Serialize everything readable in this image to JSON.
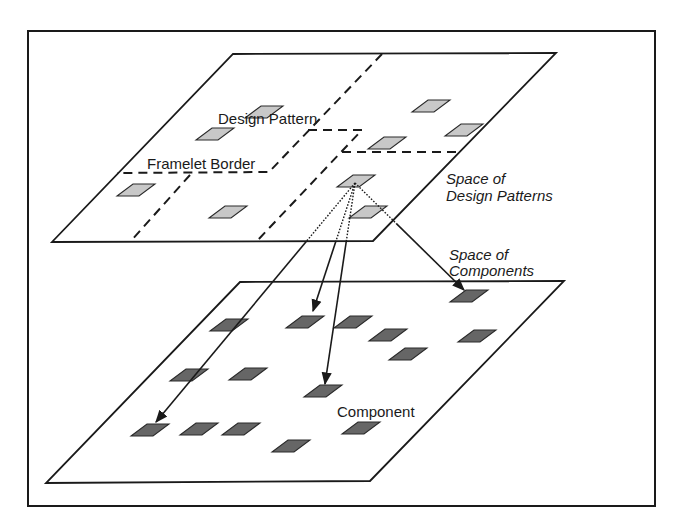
{
  "labels": {
    "design_pattern": "Design Pattern",
    "framelet_border": "Framelet Border",
    "space_design_patterns_line1": "Space of",
    "space_design_patterns_line2": "Design Patterns",
    "space_components_line1": "Space of",
    "space_components_line2": "Components",
    "component": "Component"
  },
  "colors": {
    "line": "#1a1a1a",
    "design_pattern_fill": "#c8c8c8",
    "component_fill": "#666666",
    "background": "#ffffff"
  },
  "planes": {
    "design_pattern_space": {
      "corners": [
        [
          233,
          54
        ],
        [
          556,
          53
        ],
        [
          373,
          241
        ],
        [
          52,
          242
        ]
      ]
    },
    "component_space": {
      "corners": [
        [
          240,
          282
        ],
        [
          564,
          281
        ],
        [
          370,
          481
        ],
        [
          46,
          483
        ]
      ]
    }
  },
  "framelet_borders": [
    [
      [
        382,
        54
      ],
      [
        269,
        172
      ],
      [
        117,
        173
      ]
    ],
    [
      [
        190,
        175
      ],
      [
        130,
        242
      ]
    ],
    [
      [
        308,
        130
      ],
      [
        362,
        130
      ],
      [
        256,
        242
      ]
    ],
    [
      [
        342,
        152
      ],
      [
        462,
        152
      ]
    ]
  ],
  "design_patterns": [
    [
      431,
      106
    ],
    [
      464,
      130
    ],
    [
      264,
      112
    ],
    [
      387,
      143
    ],
    [
      215,
      134
    ],
    [
      136,
      190
    ],
    [
      228,
      212
    ],
    [
      356,
      181
    ],
    [
      368,
      212
    ]
  ],
  "components": [
    [
      469,
      296
    ],
    [
      229,
      325
    ],
    [
      305,
      322
    ],
    [
      353,
      322
    ],
    [
      388,
      335
    ],
    [
      477,
      336
    ],
    [
      408,
      354
    ],
    [
      189,
      375
    ],
    [
      248,
      374
    ],
    [
      323,
      391
    ],
    [
      150,
      430
    ],
    [
      199,
      429
    ],
    [
      241,
      429
    ],
    [
      361,
      428
    ],
    [
      291,
      446
    ]
  ],
  "mappings": {
    "source": [
      355,
      183
    ],
    "targets": [
      [
        313,
        311
      ],
      [
        325,
        384
      ],
      [
        156,
        422
      ],
      [
        464,
        290
      ]
    ]
  }
}
